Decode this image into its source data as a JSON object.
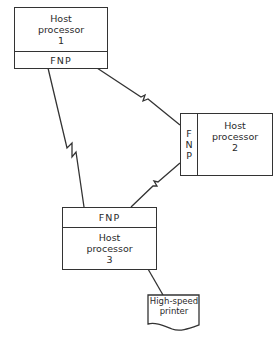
{
  "diagram": {
    "nodes": [
      {
        "id": "host1",
        "title_line1": "Host",
        "title_line2": "processor",
        "number": "1",
        "fnp_label": "FNP",
        "fnp_position": "bottom"
      },
      {
        "id": "host2",
        "title_line1": "Host",
        "title_line2": "processor",
        "number": "2",
        "fnp_label": "FNP",
        "fnp_letters": [
          "F",
          "N",
          "P"
        ],
        "fnp_position": "left"
      },
      {
        "id": "host3",
        "title_line1": "Host",
        "title_line2": "processor",
        "number": "3",
        "fnp_label": "FNP",
        "fnp_position": "top"
      },
      {
        "id": "printer",
        "line1": "High-speed",
        "line2": "printer",
        "shape": "document"
      }
    ],
    "edges": [
      {
        "from": "host1.FNP",
        "to": "host3.FNP",
        "type": "communication-link"
      },
      {
        "from": "host1.FNP",
        "to": "host2.FNP",
        "type": "communication-link"
      },
      {
        "from": "host2.FNP",
        "to": "host3.FNP",
        "type": "communication-link"
      },
      {
        "from": "host3",
        "to": "printer",
        "type": "direct-connection"
      }
    ],
    "colors": {
      "stroke": "#333333",
      "background": "#ffffff"
    }
  }
}
